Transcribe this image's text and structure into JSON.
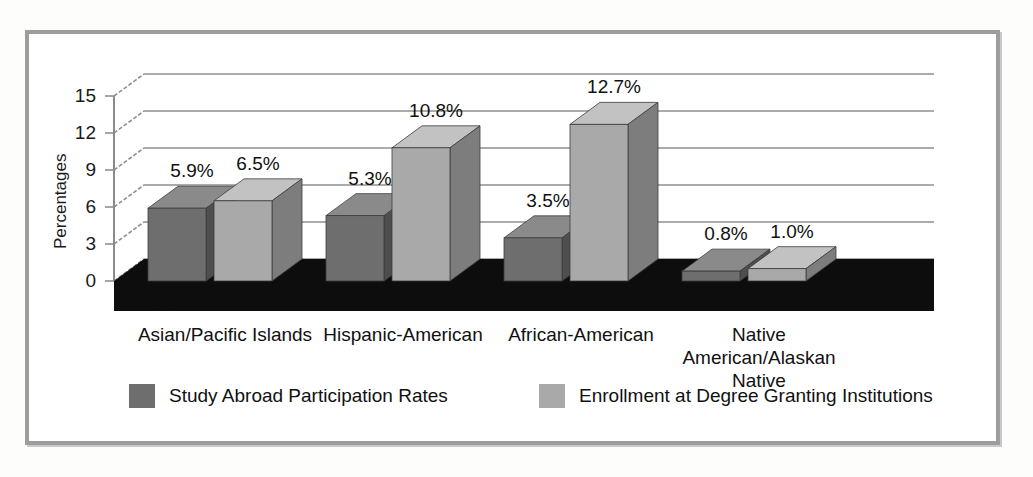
{
  "chart_data": {
    "type": "bar",
    "title": "",
    "subtitle": "",
    "xlabel": "",
    "ylabel": "Percentages",
    "ylim": [
      0,
      15
    ],
    "yticks": [
      0,
      3,
      6,
      9,
      12,
      15
    ],
    "ytick_labels": [
      "0",
      "3",
      "6",
      "9",
      "12",
      "15"
    ],
    "grid": true,
    "grid_axis": "y",
    "legend_position": "bottom",
    "three_d": true,
    "categories": [
      "Asian/Pacific Islands",
      "Hispanic-American",
      "African-American",
      "Native American/Alaskan Native"
    ],
    "series": [
      {
        "name": "Study Abroad Participation Rates",
        "color": "#6e6e6e",
        "values": [
          5.9,
          5.3,
          3.5,
          0.8
        ],
        "labels": [
          "5.9%",
          "5.3%",
          "3.5%",
          "0.8%"
        ]
      },
      {
        "name": "Enrollment at Degree Granting Institutions",
        "color": "#a9a9a9",
        "values": [
          6.5,
          10.8,
          12.7,
          1.0
        ],
        "labels": [
          "6.5%",
          "10.8%",
          "12.7%",
          "1.0%"
        ]
      }
    ]
  },
  "axis": {
    "y_title": "Percentages",
    "ticks": [
      "15",
      "12",
      "9",
      "6",
      "3",
      "0"
    ]
  },
  "categories": [
    {
      "id": "asian-pacific-islands",
      "lines": [
        "Asian/Pacific Islands"
      ]
    },
    {
      "id": "hispanic-american",
      "lines": [
        "Hispanic-American"
      ]
    },
    {
      "id": "african-american",
      "lines": [
        "African-American"
      ]
    },
    {
      "id": "native-american-alaskan-native",
      "lines": [
        "Native",
        "American/Alaskan",
        "Native"
      ]
    }
  ],
  "value_labels": [
    "5.9%",
    "6.5%",
    "5.3%",
    "10.8%",
    "3.5%",
    "12.7%",
    "0.8%",
    "1.0%"
  ],
  "legend": {
    "items": [
      {
        "label": "Study Abroad Participation Rates",
        "color": "#6e6e6e"
      },
      {
        "label": "Enrollment at Degree Granting Institutions",
        "color": "#a9a9a9"
      }
    ]
  },
  "colors": {
    "series_1_front": "#6e6e6e",
    "series_1_top": "#8a8a8a",
    "series_1_side": "#4e4e4e",
    "series_2_front": "#a9a9a9",
    "series_2_top": "#c2c2c2",
    "series_2_side": "#7d7d7d",
    "floor": "#0d0d0d",
    "grid": "#8f8f8f",
    "frame": "#9d9d9d",
    "text": "#111111"
  }
}
